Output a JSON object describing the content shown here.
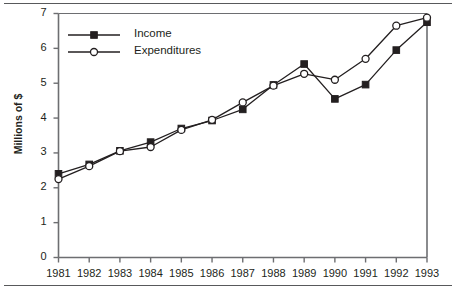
{
  "chart_data": {
    "type": "line",
    "title": "",
    "subtitle": "",
    "xlabel": "",
    "ylabel": "Millions of $",
    "categories": [
      "1981",
      "1982",
      "1983",
      "1984",
      "1985",
      "1986",
      "1987",
      "1988",
      "1989",
      "1990",
      "1991",
      "1992",
      "1993"
    ],
    "x_tick_labels": [
      "1981",
      "1982",
      "1983",
      "1984",
      "1985",
      "1986",
      "1987",
      "1988",
      "1989",
      "1990",
      "1991",
      "1992",
      "1993"
    ],
    "y_tick_labels": [
      "0",
      "1",
      "2",
      "3",
      "4",
      "5",
      "6",
      "7"
    ],
    "y_ticks": [
      0,
      1,
      2,
      3,
      4,
      5,
      6,
      7
    ],
    "ylim": [
      0,
      7
    ],
    "xlim": [
      "1981",
      "1993"
    ],
    "grid": false,
    "legend_position": "top-left inside",
    "series": [
      {
        "name": "Income",
        "marker": "filled-square",
        "color": "#231f20",
        "values": [
          2.4,
          2.67,
          3.06,
          3.31,
          3.7,
          3.93,
          4.25,
          4.95,
          5.55,
          4.55,
          4.96,
          5.95,
          6.75
        ]
      },
      {
        "name": "Expenditures",
        "marker": "open-circle",
        "color": "#231f20",
        "values": [
          2.25,
          2.62,
          3.05,
          3.17,
          3.66,
          3.95,
          4.45,
          4.93,
          5.27,
          5.1,
          5.7,
          6.65,
          6.88
        ]
      }
    ],
    "annotations": []
  },
  "legend": {
    "entries": [
      {
        "label": "Income"
      },
      {
        "label": "Expenditures"
      }
    ]
  },
  "colors": {
    "line": "#231f20",
    "axis": "#6d6e71",
    "rule": "#58595b",
    "marker_fill_income": "#231f20",
    "marker_fill_expenditures": "#ffffff",
    "text": "#231f20",
    "background": "#ffffff"
  }
}
